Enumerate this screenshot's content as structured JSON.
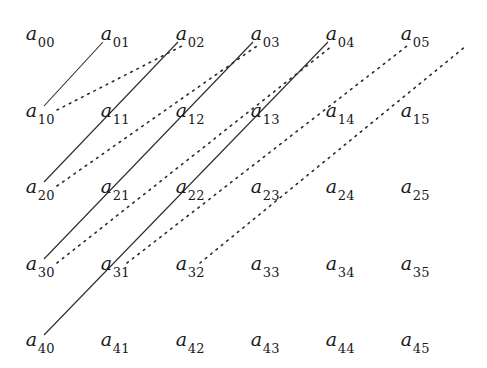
{
  "figure": {
    "width": 487,
    "height": 368,
    "background_color": "#ffffff",
    "ink_color": "#1a1a1a"
  },
  "matrix": {
    "rows": 5,
    "cols": 6,
    "symbol": "a",
    "row_y": [
      35,
      112,
      188,
      265,
      341
    ],
    "col_x": [
      40,
      115,
      190,
      265,
      340,
      415
    ],
    "cells": [
      [
        {
          "label": "a",
          "sub": "00",
          "x": 40,
          "y": 35
        },
        {
          "label": "a",
          "sub": "01",
          "x": 115,
          "y": 35
        },
        {
          "label": "a",
          "sub": "02",
          "x": 190,
          "y": 35
        },
        {
          "label": "a",
          "sub": "03",
          "x": 265,
          "y": 35
        },
        {
          "label": "a",
          "sub": "04",
          "x": 340,
          "y": 35
        },
        {
          "label": "a",
          "sub": "05",
          "x": 415,
          "y": 35
        }
      ],
      [
        {
          "label": "a",
          "sub": "10",
          "x": 40,
          "y": 112
        },
        {
          "label": "a",
          "sub": "11",
          "x": 115,
          "y": 112
        },
        {
          "label": "a",
          "sub": "12",
          "x": 190,
          "y": 112
        },
        {
          "label": "a",
          "sub": "13",
          "x": 265,
          "y": 112
        },
        {
          "label": "a",
          "sub": "14",
          "x": 340,
          "y": 112
        },
        {
          "label": "a",
          "sub": "15",
          "x": 415,
          "y": 112
        }
      ],
      [
        {
          "label": "a",
          "sub": "20",
          "x": 40,
          "y": 188
        },
        {
          "label": "a",
          "sub": "21",
          "x": 115,
          "y": 188
        },
        {
          "label": "a",
          "sub": "22",
          "x": 190,
          "y": 188
        },
        {
          "label": "a",
          "sub": "23",
          "x": 265,
          "y": 188
        },
        {
          "label": "a",
          "sub": "24",
          "x": 340,
          "y": 188
        },
        {
          "label": "a",
          "sub": "25",
          "x": 415,
          "y": 188
        }
      ],
      [
        {
          "label": "a",
          "sub": "30",
          "x": 40,
          "y": 265
        },
        {
          "label": "a",
          "sub": "31",
          "x": 115,
          "y": 265
        },
        {
          "label": "a",
          "sub": "32",
          "x": 190,
          "y": 265
        },
        {
          "label": "a",
          "sub": "33",
          "x": 265,
          "y": 265
        },
        {
          "label": "a",
          "sub": "34",
          "x": 340,
          "y": 265
        },
        {
          "label": "a",
          "sub": "35",
          "x": 415,
          "y": 265
        }
      ],
      [
        {
          "label": "a",
          "sub": "40",
          "x": 40,
          "y": 341
        },
        {
          "label": "a",
          "sub": "41",
          "x": 115,
          "y": 341
        },
        {
          "label": "a",
          "sub": "42",
          "x": 190,
          "y": 341
        },
        {
          "label": "a",
          "sub": "43",
          "x": 265,
          "y": 341
        },
        {
          "label": "a",
          "sub": "44",
          "x": 340,
          "y": 341
        },
        {
          "label": "a",
          "sub": "45",
          "x": 415,
          "y": 341
        }
      ]
    ]
  },
  "lines": {
    "solid": {
      "style": "solid",
      "color": "#2b2b2b",
      "width": 1.1,
      "segments": [
        {
          "name": "solid-a10-to-a01",
          "x1": 44,
          "y1": 106,
          "x2": 103,
          "y2": 42
        },
        {
          "name": "solid-a20-to-a02",
          "x1": 44,
          "y1": 182,
          "x2": 178,
          "y2": 42
        },
        {
          "name": "solid-a30-to-a03",
          "x1": 44,
          "y1": 259,
          "x2": 253,
          "y2": 42
        },
        {
          "name": "solid-a40-to-a04",
          "x1": 44,
          "y1": 335,
          "x2": 328,
          "y2": 42
        }
      ]
    },
    "dotted": {
      "style": "dotted",
      "color": "#2b2b2b",
      "width": 1.6,
      "dash": "1.7 5.2",
      "segments": [
        {
          "name": "dotted-a10-to-a02",
          "x1": 57,
          "y1": 110,
          "x2": 182,
          "y2": 46
        },
        {
          "name": "dotted-a20-to-a03",
          "x1": 57,
          "y1": 186,
          "x2": 257,
          "y2": 46
        },
        {
          "name": "dotted-a30-to-a04",
          "x1": 57,
          "y1": 263,
          "x2": 332,
          "y2": 46
        },
        {
          "name": "dotted-a40-to-a05",
          "x1": 127,
          "y1": 263,
          "x2": 407,
          "y2": 46
        },
        {
          "name": "dotted-tail-right-edge",
          "x1": 200,
          "y1": 263,
          "x2": 466,
          "y2": 46
        }
      ]
    }
  }
}
